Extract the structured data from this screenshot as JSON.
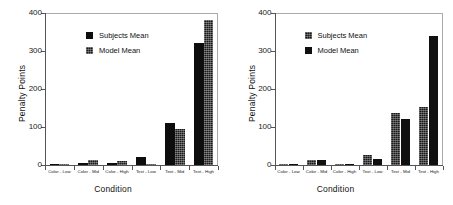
{
  "chart_data": [
    {
      "type": "bar",
      "title": "",
      "xlabel": "Condition",
      "ylabel": "Penalty Points",
      "ylim": [
        0,
        400
      ],
      "yticks": [
        0,
        100,
        200,
        300,
        400
      ],
      "grid": false,
      "legend_position": "upper center",
      "categories": [
        "Color - Low",
        "Color - Mid",
        "Color - High",
        "Text - Low",
        "Text - Mid",
        "Text - High"
      ],
      "series": [
        {
          "name": "Subjects Mean",
          "values": [
            1,
            6,
            5,
            21,
            110,
            321
          ]
        },
        {
          "name": "Model Mean",
          "values": [
            1,
            14,
            11,
            1,
            96,
            381
          ]
        }
      ]
    },
    {
      "type": "bar",
      "title": "",
      "xlabel": "Condition",
      "ylabel": "Penalty Points",
      "ylim": [
        0,
        400
      ],
      "yticks": [
        0,
        100,
        200,
        300,
        400
      ],
      "grid": false,
      "legend_position": "upper center",
      "categories": [
        "Color - Low",
        "Color - Mid",
        "Color - High",
        "Text - Low",
        "Text - Mid",
        "Text - High"
      ],
      "series": [
        {
          "name": "Subjects Mean",
          "values": [
            2,
            13,
            2,
            26,
            137,
            152
          ]
        },
        {
          "name": "Model Mean",
          "values": [
            2,
            13,
            2,
            17,
            122,
            340
          ]
        }
      ]
    }
  ],
  "panels": [
    {
      "ylabel": "Penalty Points",
      "xlabel": "Condition",
      "yticks": [
        "400",
        "300",
        "200",
        "100",
        "0"
      ],
      "categories": [
        "Color - Low",
        "Color - Mid",
        "Color - High",
        "Text - Low",
        "Text - Mid",
        "Text - High"
      ],
      "legend": {
        "subjects": "Subjects Mean",
        "model": "Model Mean"
      }
    },
    {
      "ylabel": "Penalty Points",
      "xlabel": "Condition",
      "yticks": [
        "400",
        "300",
        "200",
        "100",
        "0"
      ],
      "categories": [
        "Color - Low",
        "Color - Mid",
        "Color - High",
        "Text - Low",
        "Text - Mid",
        "Text - High"
      ],
      "legend": {
        "subjects": "Subjects Mean",
        "model": "Model Mean"
      }
    }
  ],
  "colors": {
    "subjects": "#0d0d0d",
    "model": "#1a1a1a",
    "frame": "#aaaaaa",
    "axis": "#555555",
    "background": "#ffffff"
  }
}
